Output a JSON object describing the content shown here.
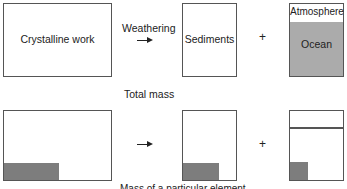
{
  "top_row": {
    "crystalline_box": {
      "label": "Crystalline work"
    },
    "process_label": "Weathering",
    "sediments_box": {
      "label": "Sediments"
    },
    "plus": "+",
    "reservoir_box": {
      "atmosphere_label": "Atmosphere",
      "ocean_label": "Ocean"
    }
  },
  "middle_caption": "Total mass",
  "bottom_row": {
    "plus": "+",
    "caption": "Mass of a particular element"
  },
  "colors": {
    "element_fill": "#7d7d7d",
    "ocean_fill": "#ababab",
    "border": "#555555"
  }
}
